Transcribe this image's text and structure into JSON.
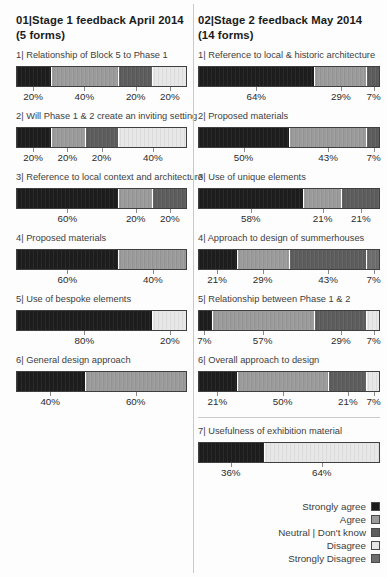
{
  "chart_data": {
    "type": "bar",
    "subtype": "horizontal-stacked-likert",
    "orientation": "horizontal",
    "value_unit": "%",
    "xlim": [
      0,
      100
    ],
    "grid": false,
    "palette": {
      "strongly_agree": "#1d1d1d",
      "agree": "#9b9b9b",
      "neutral": "#5d5d5d",
      "disagree": "#e7e7e7",
      "strongly_disagree": "#6e6e6e"
    },
    "legend": {
      "position": "bottom-right",
      "entries": [
        {
          "label": "Strongly agree",
          "category": "strongly_agree"
        },
        {
          "label": "Agree",
          "category": "agree"
        },
        {
          "label": "Neutral | Don't know",
          "category": "neutral"
        },
        {
          "label": "Disagree",
          "category": "disagree"
        },
        {
          "label": "Strongly Disagree",
          "category": "strongly_disagree"
        }
      ]
    },
    "panels": [
      {
        "prefix": "01",
        "title": "Stage 1 feedback April 2014",
        "subtitle": "(5 forms)",
        "has_legend": false,
        "bars": [
          {
            "num": "1",
            "label": "Relationship of Block 5 to Phase 1",
            "segments": [
              {
                "category": "strongly_agree",
                "value": 20
              },
              {
                "category": "agree",
                "value": 40
              },
              {
                "category": "neutral",
                "value": 20
              },
              {
                "category": "disagree",
                "value": 20
              }
            ]
          },
          {
            "num": "2",
            "label": "Will Phase 1 & 2 create an inviting setting",
            "segments": [
              {
                "category": "strongly_agree",
                "value": 20
              },
              {
                "category": "agree",
                "value": 20
              },
              {
                "category": "neutral",
                "value": 20
              },
              {
                "category": "disagree",
                "value": 40
              }
            ]
          },
          {
            "num": "3",
            "label": "Reference to local context and architecture",
            "segments": [
              {
                "category": "strongly_agree",
                "value": 60
              },
              {
                "category": "agree",
                "value": 20
              },
              {
                "category": "neutral",
                "value": 20
              }
            ]
          },
          {
            "num": "4",
            "label": "Proposed materials",
            "segments": [
              {
                "category": "strongly_agree",
                "value": 60
              },
              {
                "category": "agree",
                "value": 40
              }
            ]
          },
          {
            "num": "5",
            "label": "Use of bespoke elements",
            "segments": [
              {
                "category": "strongly_agree",
                "value": 80
              },
              {
                "category": "disagree",
                "value": 20
              }
            ]
          },
          {
            "num": "6",
            "label": "General design approach",
            "segments": [
              {
                "category": "strongly_agree",
                "value": 40
              },
              {
                "category": "agree",
                "value": 60
              }
            ]
          }
        ]
      },
      {
        "prefix": "02",
        "title": "Stage 2 feedback May 2014",
        "subtitle": "(14 forms)",
        "has_legend": true,
        "bars": [
          {
            "num": "1",
            "label": "Reference to local & historic architecture",
            "segments": [
              {
                "category": "strongly_agree",
                "value": 64
              },
              {
                "category": "agree",
                "value": 29
              },
              {
                "category": "neutral",
                "value": 7
              }
            ]
          },
          {
            "num": "2",
            "label": "Proposed materials",
            "segments": [
              {
                "category": "strongly_agree",
                "value": 50
              },
              {
                "category": "agree",
                "value": 43
              },
              {
                "category": "neutral",
                "value": 7
              }
            ]
          },
          {
            "num": "3",
            "label": "Use of unique elements",
            "segments": [
              {
                "category": "strongly_agree",
                "value": 58
              },
              {
                "category": "agree",
                "value": 21
              },
              {
                "category": "neutral",
                "value": 21
              }
            ]
          },
          {
            "num": "4",
            "label": "Approach to design of summerhouses",
            "segments": [
              {
                "category": "strongly_agree",
                "value": 21
              },
              {
                "category": "agree",
                "value": 29
              },
              {
                "category": "neutral",
                "value": 43
              },
              {
                "category": "strongly_disagree",
                "value": 7
              }
            ]
          },
          {
            "num": "5",
            "label": "Relationship between Phase 1 & 2",
            "segments": [
              {
                "category": "strongly_agree",
                "value": 7
              },
              {
                "category": "agree",
                "value": 57
              },
              {
                "category": "neutral",
                "value": 29
              },
              {
                "category": "disagree",
                "value": 7
              }
            ]
          },
          {
            "num": "6",
            "label": "Overall approach to design",
            "segments": [
              {
                "category": "strongly_agree",
                "value": 21
              },
              {
                "category": "agree",
                "value": 50
              },
              {
                "category": "neutral",
                "value": 21
              },
              {
                "category": "disagree",
                "value": 7
              }
            ]
          },
          {
            "num": "7",
            "label": "Usefulness of exhibition material",
            "divider_before": true,
            "segments": [
              {
                "category": "strongly_agree",
                "value": 36
              },
              {
                "category": "disagree",
                "value": 64
              }
            ]
          }
        ]
      }
    ]
  }
}
